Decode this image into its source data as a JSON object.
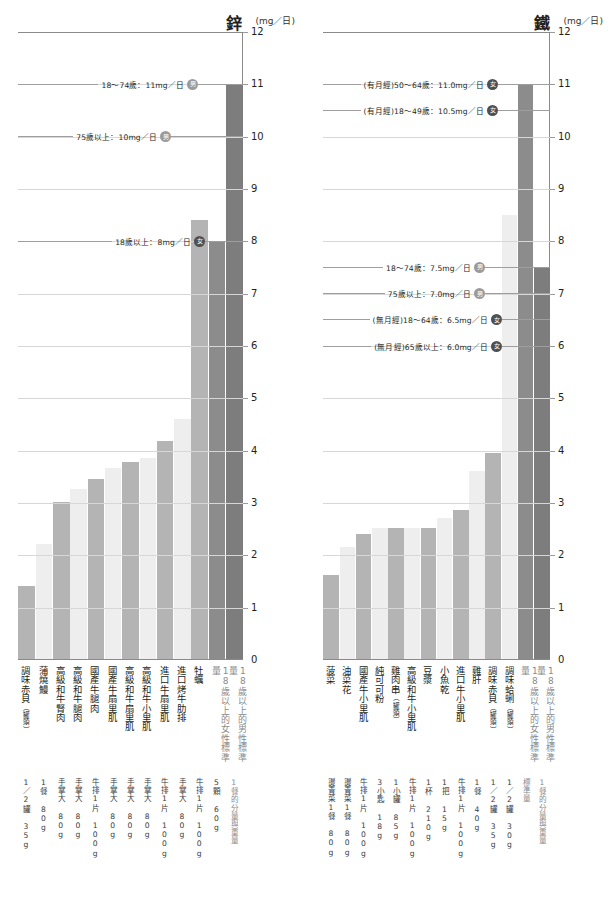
{
  "chart_data": [
    {
      "type": "bar",
      "title": "鋅",
      "unit": "(mg／日)",
      "ylabel": "",
      "xlabel": "",
      "ylim": [
        0,
        12
      ],
      "yticks": [
        0,
        1,
        2,
        3,
        4,
        5,
        6,
        7,
        8,
        9,
        10,
        11,
        12
      ],
      "grid": true,
      "legend": "none",
      "categories": [
        "調味赤貝(罐頭)",
        "蒲燒鰻",
        "高級和牛腎肉",
        "高級和牛腿肉",
        "國產牛腿肉",
        "國產牛扇里肌",
        "高級和牛扇里肌",
        "高級和牛小里肌",
        "進口牛扇里肌",
        "進口烤牛肋排",
        "牡蠣",
        "18歲以上的女性標準量",
        "18歲以上的男性標準量"
      ],
      "values": [
        1.4,
        2.2,
        3.0,
        3.25,
        3.45,
        3.65,
        3.78,
        3.85,
        4.18,
        4.6,
        8.4,
        8.0,
        11.0
      ],
      "servings": [
        "1／2罐 35g",
        "1餐 80g",
        "手掌大 80g",
        "手掌大 80g",
        "牛排1片 100g",
        "手掌大 80g",
        "手掌大 80g",
        "手掌大 80g",
        "牛排1片 100g",
        "手掌大 80g",
        "牛排1片 100g",
        "5顆 60g",
        "1餐的分量與重量"
      ],
      "annotations": [
        {
          "text": "18～74歲：11mg／日",
          "sex": "male",
          "sex_char": "男",
          "value": 11.0
        },
        {
          "text": "75歲以上：10mg／日",
          "sex": "male",
          "sex_char": "男",
          "value": 10.0
        },
        {
          "text": "18歲以上：8mg／日",
          "sex": "female",
          "sex_char": "女",
          "value": 8.0
        }
      ]
    },
    {
      "type": "bar",
      "title": "鐵",
      "unit": "(mg／日)",
      "ylabel": "",
      "xlabel": "",
      "ylim": [
        0,
        12
      ],
      "yticks": [
        0,
        1,
        2,
        3,
        4,
        5,
        6,
        7,
        8,
        9,
        10,
        11,
        12
      ],
      "grid": true,
      "legend": "none",
      "categories": [
        "菠菜",
        "油菜花",
        "國產牛小里肌",
        "純可可粉",
        "雞肉串(罐頭)",
        "高級和牛小里肌",
        "豆漿",
        "小魚乾",
        "進口牛小里肌",
        "雞肝",
        "調味赤貝(罐頭)",
        "調味蛤蜊(罐頭)",
        "18歲以上的女性標準量",
        "18歲以上的男性標準量"
      ],
      "values": [
        1.6,
        2.15,
        2.4,
        2.5,
        2.5,
        2.5,
        2.5,
        2.7,
        2.85,
        3.6,
        3.95,
        8.5,
        11.0,
        7.5
      ],
      "servings": [
        "燙青菜1餐 80g",
        "燙青菜1餐 80g",
        "牛排1片 100g",
        "3小匙 18g",
        "1小罐 85g",
        "牛排1片 100g",
        "1杯 210g",
        "1把 15g",
        "牛排1片 100g",
        "1餐 40g",
        "1／2罐 35g",
        "1／2罐 30g",
        "標準量",
        "標準量 1餐的分量與重量"
      ],
      "annotations": [
        {
          "text": "(有月經)50～64歲：11.0mg／日",
          "sex": "female",
          "sex_char": "女",
          "value": 11.0
        },
        {
          "text": "(有月經)18～49歲：10.5mg／日",
          "sex": "female",
          "sex_char": "女",
          "value": 10.5
        },
        {
          "text": "18～74歲：7.5mg／日",
          "sex": "male",
          "sex_char": "男",
          "value": 7.5
        },
        {
          "text": "75歲以上：7.0mg／日",
          "sex": "male",
          "sex_char": "男",
          "value": 7.0
        },
        {
          "text": "(無月經)18～64歲：6.5mg／日",
          "sex": "female",
          "sex_char": "女",
          "value": 6.5
        },
        {
          "text": "(無月經)65歲以上：6.0mg／日",
          "sex": "female",
          "sex_char": "女",
          "value": 6.0
        }
      ]
    }
  ],
  "zinc": {
    "title": "鋅",
    "unit": "(mg／日)",
    "xlabels": [
      {
        "main": "調味赤貝",
        "paren": "（罐頭）",
        "std": false
      },
      {
        "main": "蒲燒鰻",
        "paren": "",
        "std": false
      },
      {
        "main": "高級和牛腎肉",
        "paren": "",
        "std": false
      },
      {
        "main": "高級和牛腿肉",
        "paren": "",
        "std": false
      },
      {
        "main": "國產牛腿肉",
        "paren": "",
        "std": false
      },
      {
        "main": "國產牛扇里肌",
        "paren": "",
        "std": false
      },
      {
        "main": "高級和牛扇里肌",
        "paren": "",
        "std": false
      },
      {
        "main": "高級和牛小里肌",
        "paren": "",
        "std": false
      },
      {
        "main": "進口牛扇里肌",
        "paren": "",
        "std": false
      },
      {
        "main": "進口烤牛肋排",
        "paren": "",
        "std": false
      },
      {
        "main": "牡蠣",
        "paren": "",
        "std": false
      },
      {
        "main": "18歲以上的女性標準量",
        "paren": "",
        "std": true
      },
      {
        "main": "18歲以上的男性標準量",
        "paren": "",
        "std": true
      }
    ],
    "servings": [
      {
        "text": "1／2罐 35g",
        "std": false
      },
      {
        "text": "1餐 80g",
        "std": false
      },
      {
        "text": "手掌大 80g",
        "std": false
      },
      {
        "text": "手掌大 80g",
        "std": false
      },
      {
        "text": "牛排1片 100g",
        "std": false
      },
      {
        "text": "手掌大 80g",
        "std": false
      },
      {
        "text": "手掌大 80g",
        "std": false
      },
      {
        "text": "手掌大 80g",
        "std": false
      },
      {
        "text": "牛排1片 100g",
        "std": false
      },
      {
        "text": "手掌大 80g",
        "std": false
      },
      {
        "text": "牛排1片 100g",
        "std": false
      },
      {
        "text": "5顆 60g",
        "std": false
      },
      {
        "text": "1餐的分量與重量",
        "std": true
      }
    ]
  },
  "iron": {
    "title": "鐵",
    "unit": "(mg／日)",
    "xlabels": [
      {
        "main": "菠菜",
        "paren": "",
        "std": false
      },
      {
        "main": "油菜花",
        "paren": "",
        "std": false
      },
      {
        "main": "國產牛小里肌",
        "paren": "",
        "std": false
      },
      {
        "main": "純可可粉",
        "paren": "",
        "std": false
      },
      {
        "main": "雞肉串",
        "paren": "（罐頭）",
        "std": false
      },
      {
        "main": "高級和牛小里肌",
        "paren": "",
        "std": false
      },
      {
        "main": "豆漿",
        "paren": "",
        "std": false
      },
      {
        "main": "小魚乾",
        "paren": "",
        "std": false
      },
      {
        "main": "進口牛小里肌",
        "paren": "",
        "std": false
      },
      {
        "main": "雞肝",
        "paren": "",
        "std": false
      },
      {
        "main": "調味赤貝",
        "paren": "（罐頭）",
        "std": false
      },
      {
        "main": "調味蛤蜊",
        "paren": "（罐頭）",
        "std": false
      },
      {
        "main": "18歲以上的女性標準量",
        "paren": "",
        "std": true
      },
      {
        "main": "18歲以上的男性標準量",
        "paren": "",
        "std": true
      }
    ],
    "servings": [
      {
        "text": "燙青菜1餐 80g",
        "std": false
      },
      {
        "text": "燙青菜1餐 80g",
        "std": false
      },
      {
        "text": "牛排1片 100g",
        "std": false
      },
      {
        "text": "3小匙 18g",
        "std": false
      },
      {
        "text": "1小罐 85g",
        "std": false
      },
      {
        "text": "牛排1片 100g",
        "std": false
      },
      {
        "text": "1杯 210g",
        "std": false
      },
      {
        "text": "1把 15g",
        "std": false
      },
      {
        "text": "牛排1片 100g",
        "std": false
      },
      {
        "text": "1餐 40g",
        "std": false
      },
      {
        "text": "1／2罐 35g",
        "std": false
      },
      {
        "text": "1／2罐 30g",
        "std": false
      },
      {
        "text": "標準量",
        "std": true
      },
      {
        "text": "1餐的分量與重量",
        "std": true
      }
    ]
  },
  "colors": {
    "bar_light": "#eeeeee",
    "bar_dark": "#b4b4b4",
    "bar_standard_female": "#8c8c8c",
    "bar_standard_male": "#7d7d7d",
    "badge_male": "#9b9b9b",
    "badge_female": "#4f4f4f",
    "grid": "#d7d7d7",
    "axis": "#8a8a8a"
  },
  "footnote": ""
}
